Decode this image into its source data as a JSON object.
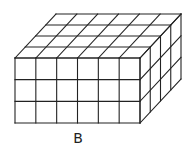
{
  "figure": {
    "label": "B",
    "shape": "rectangular prism of unit cubes",
    "dimensions": {
      "length": 6,
      "depth": 4,
      "height": 3
    },
    "line_color": "#222222",
    "background": "#ffffff"
  }
}
